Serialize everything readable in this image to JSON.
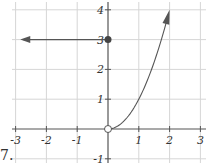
{
  "problem_number": "7.",
  "chart_data": {
    "type": "line",
    "title": "",
    "xlabel": "",
    "ylabel": "",
    "xlim": [
      -3,
      3
    ],
    "ylim": [
      -1,
      4
    ],
    "grid": true,
    "x_ticks": [
      "-3",
      "-2",
      "-1",
      "1",
      "2",
      "3"
    ],
    "y_ticks": [
      "4",
      "3",
      "2",
      "1",
      "-1"
    ],
    "series": [
      {
        "name": "left piece",
        "description": "horizontal ray y = 3 for x < 0, arrow pointing left",
        "x": [
          -3,
          0
        ],
        "y": [
          3,
          3
        ],
        "endpoint_right": "closed dot at (0, 3)",
        "arrow": "left"
      },
      {
        "name": "right piece",
        "description": "curve y = x^2 for x > 0, arrow pointing up",
        "x": [
          0,
          0.5,
          1,
          1.5,
          2
        ],
        "y": [
          0,
          0.25,
          1,
          2.25,
          4
        ],
        "endpoint_left": "open circle at (0, 0)",
        "arrow": "up-right"
      }
    ],
    "points": [
      {
        "x": 0,
        "y": 3,
        "style": "closed"
      },
      {
        "x": 0,
        "y": 0,
        "style": "open"
      }
    ]
  },
  "axis": {
    "x_labels": [
      {
        "v": -3,
        "t": "-3"
      },
      {
        "v": -2,
        "t": "-2"
      },
      {
        "v": -1,
        "t": "-1"
      },
      {
        "v": 1,
        "t": "1"
      },
      {
        "v": 2,
        "t": "2"
      },
      {
        "v": 3,
        "t": "3"
      }
    ],
    "y_labels": [
      {
        "v": 4,
        "t": "4"
      },
      {
        "v": 3,
        "t": "3"
      },
      {
        "v": 2,
        "t": "2"
      },
      {
        "v": 1,
        "t": "1"
      },
      {
        "v": -1,
        "t": "-1"
      }
    ]
  }
}
